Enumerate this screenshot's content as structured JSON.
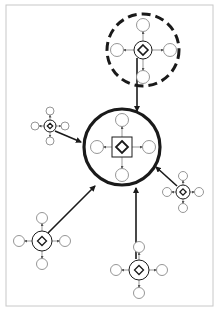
{
  "diagram": {
    "type": "hub-and-spoke network",
    "frame": {
      "x": 6,
      "y": 5,
      "width": 207,
      "height": 301,
      "stroke": "#c8c8c8"
    },
    "colors": {
      "ink": "#1a1a1a",
      "satellite_stroke": "#8a8a8a",
      "spoke": "#6a6a6a",
      "background": "#ffffff"
    },
    "central_node": {
      "id": "main",
      "cx": 122,
      "cy": 147,
      "r": 38,
      "hub_shape": "square-with-diamond",
      "satellites": [
        {
          "cx": 122,
          "cy": 120
        },
        {
          "cx": 97,
          "cy": 147
        },
        {
          "cx": 149,
          "cy": 147
        },
        {
          "cx": 122,
          "cy": 175
        }
      ]
    },
    "dashed_node": {
      "id": "dashed",
      "cx": 143,
      "cy": 50,
      "r": 36,
      "hub_r": 9,
      "satellites": [
        {
          "cx": 143,
          "cy": 25
        },
        {
          "cx": 117,
          "cy": 50
        },
        {
          "cx": 170,
          "cy": 50
        },
        {
          "cx": 143,
          "cy": 77
        }
      ]
    },
    "peripheral_nodes": [
      {
        "id": "top-left",
        "cx": 50,
        "cy": 126,
        "hub_r": 6,
        "sat_r": 4,
        "arm": 15
      },
      {
        "id": "right",
        "cx": 183,
        "cy": 192,
        "hub_r": 7,
        "sat_r": 4.5,
        "arm": 16
      },
      {
        "id": "bottom-left",
        "cx": 42,
        "cy": 241,
        "hub_r": 10,
        "sat_r": 5.5,
        "arm": 23
      },
      {
        "id": "bottom",
        "cx": 139,
        "cy": 270,
        "hub_r": 10,
        "sat_r": 5.5,
        "arm": 23
      }
    ],
    "edges": [
      {
        "from": "dashed",
        "to": "main",
        "x1": 137,
        "y1": 58,
        "x2": 137,
        "y2": 111
      },
      {
        "from": "top-left",
        "to": "main",
        "x1": 55,
        "y1": 131,
        "x2": 81,
        "y2": 142
      },
      {
        "from": "right",
        "to": "main",
        "x1": 177,
        "y1": 186,
        "x2": 156,
        "y2": 167
      },
      {
        "from": "bottom-left",
        "to": "main",
        "x1": 48,
        "y1": 233,
        "x2": 95,
        "y2": 186
      },
      {
        "from": "bottom",
        "to": "main",
        "x1": 136,
        "y1": 259,
        "x2": 136,
        "y2": 188
      }
    ]
  }
}
